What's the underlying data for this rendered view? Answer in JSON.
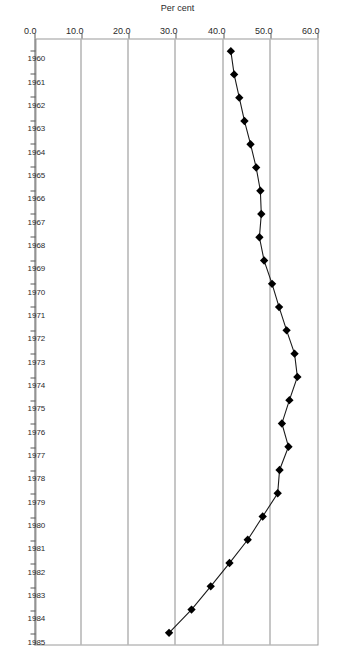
{
  "chart_data": {
    "type": "line",
    "title": "",
    "xlabel": "",
    "ylabel": "Per cent",
    "orientation": "page-rotated-90-clockwise",
    "grid": true,
    "legend": false,
    "xlim": [
      1960,
      1985
    ],
    "ylim": [
      0.0,
      60.0
    ],
    "ytick_labels": [
      "0.0",
      "10.0",
      "20.0",
      "30.0",
      "40.0",
      "50.0",
      "60.0"
    ],
    "ytick_values": [
      0.0,
      10.0,
      20.0,
      30.0,
      40.0,
      50.0,
      60.0
    ],
    "gridline_values": [
      10.0,
      20.0,
      30.0,
      40.0,
      50.0
    ],
    "marker": "diamond",
    "categories": [
      "1960",
      "1961",
      "1962",
      "1963",
      "1964",
      "1965",
      "1966",
      "1967",
      "1968",
      "1969",
      "1970",
      "1971",
      "1972",
      "1973",
      "1974",
      "1975",
      "1976",
      "1977",
      "1978",
      "1979",
      "1980",
      "1981",
      "1982",
      "1983",
      "1984",
      "1985"
    ],
    "values": [
      41.5,
      42.2,
      43.3,
      44.4,
      45.7,
      46.9,
      47.8,
      48.0,
      47.6,
      48.6,
      50.3,
      51.8,
      53.4,
      55.1,
      55.7,
      54.0,
      52.4,
      53.8,
      51.9,
      51.5,
      48.3,
      45.1,
      41.2,
      37.2,
      33.1,
      28.3
    ],
    "series": [
      {
        "name": "Per cent",
        "values": [
          41.5,
          42.2,
          43.3,
          44.4,
          45.7,
          46.9,
          47.8,
          48.0,
          47.6,
          48.6,
          50.3,
          51.8,
          53.4,
          55.1,
          55.7,
          54.0,
          52.4,
          53.8,
          51.9,
          51.5,
          48.3,
          45.1,
          41.2,
          37.2,
          33.1,
          28.3
        ]
      }
    ],
    "colors": {
      "line": "#1a1a1a",
      "marker": "#000000",
      "grid": "#8d8d8d",
      "axis": "#5a5a5a",
      "background": "#ffffff"
    }
  }
}
